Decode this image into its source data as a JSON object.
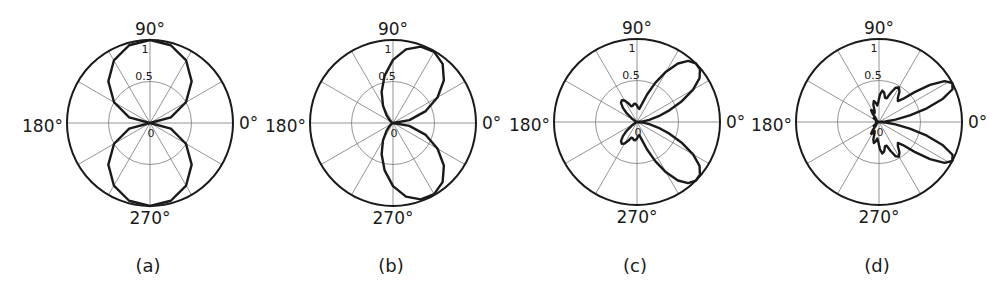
{
  "chart_data": [
    {
      "type": "line",
      "subtype": "polar",
      "caption": "(a)",
      "angle_labels": {
        "0": "0°",
        "90": "90°",
        "180": "180°",
        "270": "270°"
      },
      "radial_tick_labels": [
        "0",
        "0.5",
        "1"
      ],
      "radial_range": [
        0,
        1
      ],
      "angular_grid_deg": 30,
      "grid": true,
      "series": [
        {
          "name": "pattern-a",
          "theta_deg": [
            0,
            15,
            30,
            45,
            60,
            75,
            90,
            105,
            120,
            135,
            150,
            165,
            180,
            195,
            210,
            225,
            240,
            255,
            270,
            285,
            300,
            315,
            330,
            345,
            360
          ],
          "r": [
            0,
            0.26,
            0.5,
            0.71,
            0.87,
            0.97,
            1,
            0.97,
            0.87,
            0.71,
            0.5,
            0.26,
            0,
            0.26,
            0.5,
            0.71,
            0.87,
            0.97,
            1,
            0.97,
            0.87,
            0.71,
            0.5,
            0.26,
            0
          ]
        }
      ]
    },
    {
      "type": "line",
      "subtype": "polar",
      "caption": "(b)",
      "angle_labels": {
        "0": "0°",
        "90": "90°",
        "180": "180°",
        "270": "270°"
      },
      "radial_tick_labels": [
        "0",
        "0.5",
        "1"
      ],
      "radial_range": [
        0,
        1
      ],
      "angular_grid_deg": 30,
      "grid": true,
      "series": [
        {
          "name": "pattern-b",
          "theta_deg": [
            0,
            10,
            20,
            30,
            40,
            50,
            60,
            70,
            80,
            90,
            100,
            110,
            120,
            130,
            140,
            150,
            160,
            170,
            180,
            190,
            200,
            210,
            220,
            230,
            240,
            250,
            260,
            270,
            280,
            290,
            300,
            310,
            320,
            330,
            340,
            350,
            360
          ],
          "r": [
            0,
            0.2,
            0.42,
            0.62,
            0.8,
            0.93,
            0.99,
            0.98,
            0.9,
            0.76,
            0.58,
            0.4,
            0.24,
            0.12,
            0.05,
            0.02,
            0.01,
            0,
            0,
            0,
            0.01,
            0.02,
            0.05,
            0.12,
            0.24,
            0.4,
            0.58,
            0.76,
            0.9,
            0.98,
            0.99,
            0.93,
            0.8,
            0.62,
            0.42,
            0.2,
            0
          ]
        }
      ]
    },
    {
      "type": "line",
      "subtype": "polar",
      "caption": "(c)",
      "angle_labels": {
        "0": "0°",
        "90": "90°",
        "180": "180°",
        "270": "270°"
      },
      "radial_tick_labels": [
        "0",
        "0.5",
        "1"
      ],
      "radial_range": [
        0,
        1
      ],
      "angular_grid_deg": 30,
      "grid": true,
      "series": [
        {
          "name": "pattern-c",
          "theta_deg": [
            0,
            5,
            10,
            15,
            20,
            25,
            30,
            35,
            40,
            45,
            50,
            55,
            60,
            65,
            70,
            75,
            80,
            85,
            90,
            95,
            100,
            105,
            110,
            115,
            120,
            125,
            130,
            135,
            140,
            145,
            150,
            155,
            160,
            165,
            170,
            175,
            180,
            185,
            190,
            195,
            200,
            205,
            210,
            215,
            220,
            225,
            230,
            235,
            240,
            245,
            250,
            255,
            260,
            265,
            270,
            275,
            280,
            285,
            290,
            295,
            300,
            305,
            310,
            315,
            320,
            325,
            330,
            335,
            340,
            345,
            350,
            355,
            360
          ],
          "r": [
            0,
            0.06,
            0.15,
            0.27,
            0.42,
            0.6,
            0.78,
            0.92,
            0.99,
            1,
            0.96,
            0.86,
            0.7,
            0.52,
            0.35,
            0.22,
            0.16,
            0.17,
            0.2,
            0.22,
            0.22,
            0.2,
            0.2,
            0.25,
            0.3,
            0.32,
            0.3,
            0.24,
            0.16,
            0.08,
            0.03,
            0.01,
            0,
            0,
            0,
            0,
            0,
            0,
            0,
            0,
            0,
            0.01,
            0.03,
            0.08,
            0.16,
            0.24,
            0.3,
            0.32,
            0.3,
            0.25,
            0.2,
            0.2,
            0.22,
            0.22,
            0.2,
            0.17,
            0.16,
            0.22,
            0.35,
            0.52,
            0.7,
            0.86,
            0.96,
            1,
            0.99,
            0.92,
            0.78,
            0.6,
            0.42,
            0.27,
            0.15,
            0.06,
            0
          ]
        }
      ]
    },
    {
      "type": "line",
      "subtype": "polar",
      "caption": "(d)",
      "angle_labels": {
        "0": "0°",
        "90": "90°",
        "180": "180°",
        "270": "270°"
      },
      "radial_tick_labels": [
        "0",
        "0.5",
        "1"
      ],
      "radial_range": [
        0,
        1
      ],
      "angular_grid_deg": 30,
      "grid": true,
      "series": [
        {
          "name": "pattern-d",
          "theta_deg": [
            0,
            4,
            8,
            12,
            16,
            20,
            24,
            28,
            32,
            36,
            40,
            44,
            48,
            52,
            56,
            60,
            64,
            68,
            72,
            76,
            80,
            84,
            88,
            92,
            96,
            100,
            104,
            108,
            112,
            116,
            120,
            124,
            128,
            132,
            136,
            140,
            144,
            148,
            152,
            156,
            160,
            164,
            168,
            172,
            176,
            180,
            184,
            188,
            192,
            196,
            200,
            204,
            208,
            212,
            216,
            220,
            224,
            228,
            232,
            236,
            240,
            244,
            248,
            252,
            256,
            260,
            264,
            268,
            272,
            276,
            280,
            284,
            288,
            292,
            296,
            300,
            304,
            308,
            312,
            316,
            320,
            324,
            328,
            332,
            336,
            340,
            344,
            348,
            352,
            356,
            360
          ],
          "r": [
            0,
            0.08,
            0.2,
            0.38,
            0.6,
            0.82,
            0.97,
            1,
            0.93,
            0.76,
            0.56,
            0.4,
            0.34,
            0.37,
            0.44,
            0.48,
            0.46,
            0.38,
            0.3,
            0.3,
            0.36,
            0.38,
            0.33,
            0.24,
            0.2,
            0.24,
            0.26,
            0.22,
            0.14,
            0.12,
            0.16,
            0.17,
            0.12,
            0.06,
            0.05,
            0.08,
            0.08,
            0.05,
            0.02,
            0.02,
            0.04,
            0.03,
            0.01,
            0,
            0,
            0,
            0,
            0,
            0.01,
            0.03,
            0.04,
            0.02,
            0.02,
            0.05,
            0.08,
            0.08,
            0.05,
            0.06,
            0.12,
            0.17,
            0.16,
            0.12,
            0.14,
            0.22,
            0.26,
            0.24,
            0.2,
            0.24,
            0.33,
            0.38,
            0.36,
            0.3,
            0.3,
            0.38,
            0.46,
            0.48,
            0.44,
            0.37,
            0.34,
            0.4,
            0.56,
            0.76,
            0.93,
            1,
            0.97,
            0.82,
            0.6,
            0.38,
            0.2,
            0.08,
            0
          ]
        }
      ]
    }
  ],
  "edge_fragments": {
    "left_of_b": "°",
    "right_of_c": "1"
  }
}
